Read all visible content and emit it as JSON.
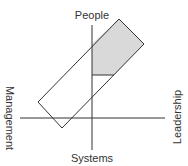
{
  "diagram": {
    "labels": {
      "top": "People",
      "bottom": "Systems",
      "left": "Management",
      "right": "Leadership"
    },
    "colors": {
      "line": "#333333",
      "shade": "#d9d9d9",
      "text": "#333333"
    }
  }
}
